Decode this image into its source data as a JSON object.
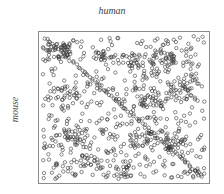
{
  "chart_data": {
    "type": "scatter",
    "title": "human",
    "xlabel": "human",
    "ylabel": "mouse",
    "grid": false,
    "legend": null,
    "xlim": [
      0,
      100
    ],
    "ylim": [
      0,
      100
    ],
    "marker": "open-circle",
    "marker_color": "#3a3a3a",
    "diagonal": {
      "from": [
        0,
        100
      ],
      "to": [
        100,
        0
      ]
    },
    "seed": 7,
    "random_points": 520,
    "clusters": [
      {
        "x": 10,
        "y": 90,
        "n": 40
      },
      {
        "x": 38,
        "y": 85,
        "n": 22
      },
      {
        "x": 55,
        "y": 82,
        "n": 22
      },
      {
        "x": 75,
        "y": 84,
        "n": 26
      },
      {
        "x": 20,
        "y": 30,
        "n": 28
      },
      {
        "x": 30,
        "y": 12,
        "n": 24
      },
      {
        "x": 60,
        "y": 28,
        "n": 26
      },
      {
        "x": 82,
        "y": 25,
        "n": 30
      },
      {
        "x": 65,
        "y": 55,
        "n": 20
      },
      {
        "x": 85,
        "y": 60,
        "n": 20
      },
      {
        "x": 15,
        "y": 60,
        "n": 18
      },
      {
        "x": 50,
        "y": 5,
        "n": 20
      }
    ]
  }
}
